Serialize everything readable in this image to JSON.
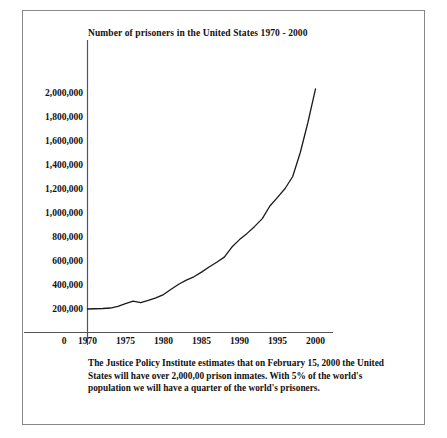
{
  "document": {
    "border_color": "#888888",
    "background": "#ffffff"
  },
  "caption": {
    "line1": "The Justice Policy Institute estimates that on February 15, 2000 the United",
    "line2": "States will have over 2,000,00 prison inmates.  With 5% of the world's",
    "line3": "population we will have a quarter of the world's prisoners."
  },
  "chart_data": {
    "type": "line",
    "title": "Number of prisoners in the United States 1970 - 2000",
    "xlabel": "",
    "ylabel": "",
    "xlim": [
      1970,
      2000
    ],
    "ylim": [
      0,
      2100000
    ],
    "grid": false,
    "legend": false,
    "line_color": "#1a1a1a",
    "y_origin_label": "0",
    "yticks": [
      "2,000,000",
      "1,800,000",
      "1,600,000",
      "1,400,000",
      "1,200,000",
      "1,000,000",
      "800,000",
      "600,000",
      "400,000",
      "200,000"
    ],
    "ytick_values": [
      2000000,
      1800000,
      1600000,
      1400000,
      1200000,
      1000000,
      800000,
      600000,
      400000,
      200000
    ],
    "xticks": [
      "1970",
      "1975",
      "1980",
      "1985",
      "1990",
      "1995",
      "2000"
    ],
    "xtick_values": [
      1970,
      1975,
      1980,
      1985,
      1990,
      1995,
      2000
    ],
    "x": [
      1970,
      1971,
      1972,
      1973,
      1974,
      1975,
      1976,
      1977,
      1978,
      1979,
      1980,
      1981,
      1982,
      1983,
      1984,
      1985,
      1986,
      1987,
      1988,
      1989,
      1990,
      1991,
      1992,
      1993,
      1994,
      1995,
      1996,
      1997,
      1998,
      1999,
      2000
    ],
    "values": [
      196000,
      198000,
      200000,
      204000,
      218000,
      241000,
      262000,
      248000,
      268000,
      288000,
      316000,
      360000,
      402000,
      437000,
      464000,
      503000,
      546000,
      586000,
      628000,
      712000,
      774000,
      826000,
      884000,
      949000,
      1054000,
      1126000,
      1200000,
      1300000,
      1500000,
      1750000,
      2030000
    ],
    "series": [
      {
        "name": "U.S. prison population",
        "values": [
          196000,
          198000,
          200000,
          204000,
          218000,
          241000,
          262000,
          248000,
          268000,
          288000,
          316000,
          360000,
          402000,
          437000,
          464000,
          503000,
          546000,
          586000,
          628000,
          712000,
          774000,
          826000,
          884000,
          949000,
          1054000,
          1126000,
          1200000,
          1300000,
          1500000,
          1750000,
          2030000
        ]
      }
    ]
  }
}
